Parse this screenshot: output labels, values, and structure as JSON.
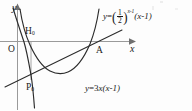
{
  "figure": {
    "kind": "cartesian-math-diagram",
    "background_color": "#fdfdfd",
    "stroke_color": "#2b2b2b",
    "axis_color": "#888888",
    "axes": {
      "x_label": "x",
      "y_label": "y",
      "origin_label": "O"
    },
    "points": [
      {
        "id": "H",
        "label": "H",
        "subscript": "0"
      },
      {
        "id": "A",
        "label": "A",
        "subscript": ""
      },
      {
        "id": "P",
        "label": "P",
        "subscript": "0"
      }
    ],
    "equations": {
      "exponential": {
        "lhs": "y",
        "equals": "=",
        "base_open_paren": "(",
        "base_numerator": "1",
        "base_denominator": "2",
        "base_close_paren": ")",
        "exponent": "x-1",
        "factor": "(x-1)",
        "plain": "y=(1/2)^(x-1)(x-1)"
      },
      "parabola": {
        "plain": "y=3x(x-1)",
        "lhs": "y",
        "equals": "=",
        "coefficient": "3",
        "variable": "x",
        "factor": "(x-1)"
      }
    },
    "curves": [
      {
        "name": "exponential-curve",
        "description": "steep decreasing curve crossing the y-axis region"
      },
      {
        "name": "parabola-curve",
        "description": "upward-opening parabola with roots at 0 and 1"
      },
      {
        "name": "secant-line",
        "description": "straight line through P and A"
      }
    ]
  }
}
